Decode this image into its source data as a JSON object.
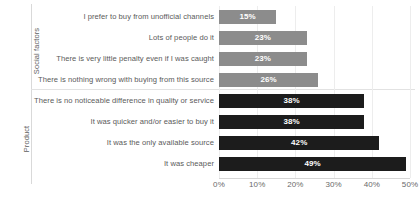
{
  "chart_data": {
    "type": "bar",
    "orientation": "horizontal",
    "title": "",
    "xlabel": "",
    "ylabel": "",
    "xlim": [
      0,
      50
    ],
    "grid": true,
    "legend": "none",
    "value_suffix": "%",
    "xticks": [
      "0%",
      "10%",
      "20%",
      "30%",
      "40%",
      "50%"
    ],
    "xtick_values": [
      0,
      10,
      20,
      30,
      40,
      50
    ],
    "groups": [
      {
        "name": "Social factors",
        "color": "#8c8c8c",
        "categories": [
          "I prefer to buy from unofficial channels",
          "Lots of people do it",
          "There is very little penalty even if I was caught",
          "There is nothing wrong with buying from this source"
        ],
        "values": [
          15,
          23,
          23,
          26
        ],
        "labels": [
          "15%",
          "23%",
          "23%",
          "26%"
        ]
      },
      {
        "name": "Product",
        "color": "#1c1c1c",
        "categories": [
          "There is no noticeable difference in quality or service",
          "It was quicker and/or easier to buy it",
          "It was the only available source",
          "It was cheaper"
        ],
        "values": [
          38,
          38,
          42,
          49
        ],
        "labels": [
          "38%",
          "38%",
          "42%",
          "49%"
        ]
      }
    ],
    "categories": [
      "I prefer to buy from unofficial channels",
      "Lots of people do it",
      "There is very little penalty even if I was caught",
      "There is nothing wrong with buying from this source",
      "There is no noticeable difference in quality or service",
      "It was quicker and/or easier to buy it",
      "It was the only available source",
      "It was cheaper"
    ],
    "values": [
      15,
      23,
      23,
      26,
      38,
      38,
      42,
      49
    ]
  },
  "colors": {
    "social_bar": "#8c8c8c",
    "product_bar": "#1c1c1c",
    "gridline": "#ededed",
    "axis": "#d6d6d6",
    "text": "#5a5a5a",
    "value_text": "#ffffff",
    "background": "#ffffff"
  }
}
